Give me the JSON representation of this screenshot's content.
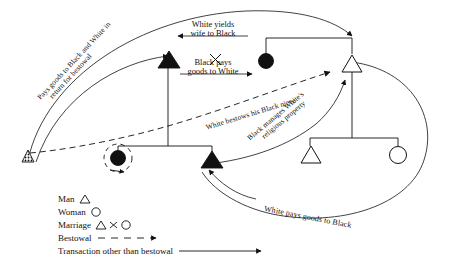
{
  "diagram": {
    "labels": {
      "pays_goods_return": {
        "line1": "Pays goods to Black and White in",
        "line2": "return for bestowal"
      },
      "white_yields": {
        "line1": "White yields",
        "line2": "wife to Black"
      },
      "black_pays": {
        "line1": "Black pays",
        "line2": "goods to White"
      },
      "white_bestows": "White bestows his Black niece",
      "black_manages": {
        "line1": "Black manages White's",
        "line2": "religious property"
      },
      "white_pays": "White pays goods to Black"
    },
    "nodes": [
      {
        "name": "hatched-man-left",
        "kind": "triangle",
        "fill": "hatched"
      },
      {
        "name": "black-man-upper",
        "kind": "triangle",
        "fill": "solid"
      },
      {
        "name": "black-woman-wife",
        "kind": "circle",
        "fill": "solid"
      },
      {
        "name": "white-man-upper",
        "kind": "triangle",
        "fill": "open"
      },
      {
        "name": "black-woman-niece",
        "kind": "circle",
        "fill": "solid"
      },
      {
        "name": "black-man-lower",
        "kind": "triangle",
        "fill": "solid"
      },
      {
        "name": "white-man-son",
        "kind": "triangle",
        "fill": "open"
      },
      {
        "name": "white-woman-daughter",
        "kind": "circle",
        "fill": "open"
      }
    ]
  },
  "legend": {
    "rows": [
      {
        "label": "Man",
        "symbol": "triangle-open"
      },
      {
        "label": "Woman",
        "symbol": "circle-open"
      },
      {
        "label": "Marriage",
        "symbol": "triangle-x-circle"
      },
      {
        "label": "Bestowal",
        "symbol": "dashed-arrow"
      },
      {
        "label": "Transaction other than bestowal",
        "symbol": "solid-arrow"
      }
    ]
  },
  "colors": {
    "ink": "#111111",
    "paper": "#ffffff"
  }
}
